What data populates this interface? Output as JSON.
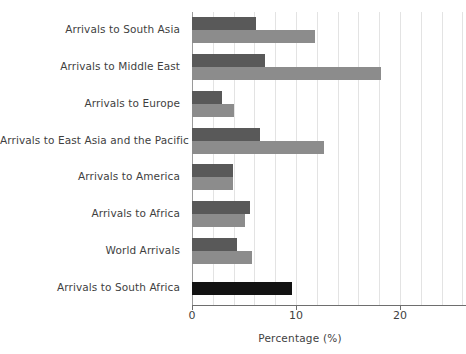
{
  "chart_data": {
    "type": "bar",
    "orientation": "horizontal",
    "title": "",
    "xlabel": "Percentage (%)",
    "ylabel": "",
    "xlim": [
      0,
      26
    ],
    "xticks": [
      0,
      10,
      20
    ],
    "xtick_labels": [
      "0",
      "10",
      "20"
    ],
    "grid": true,
    "grid_axis": "x",
    "grid_step": 2,
    "legend": "none",
    "categories": [
      "Arrivals to South Asia",
      "Arrivals to Middle East",
      "Arrivals to Europe",
      "Arrivals to East Asia and the Pacific",
      "Arrivals to America",
      "Arrivals to Africa",
      "World Arrivals",
      "Arrivals to South Africa"
    ],
    "series": [
      {
        "name": "series-dark",
        "color": "#595959",
        "values": [
          6.2,
          7.0,
          2.9,
          6.5,
          3.9,
          5.6,
          4.3,
          9.6
        ]
      },
      {
        "name": "series-light",
        "color": "#8c8c8c",
        "values": [
          11.8,
          18.2,
          4.0,
          12.7,
          3.9,
          5.1,
          5.8,
          null
        ]
      }
    ],
    "highlight": {
      "category": "Arrivals to South Africa",
      "color": "#121212",
      "value": 9.6
    },
    "colors": {
      "dark_bar": "#595959",
      "light_bar": "#8c8c8c",
      "highlight_bar": "#121212",
      "gridline": "#e3e3e3",
      "axis": "#6e6e6e",
      "text": "#3f3f3f",
      "background": "#ffffff"
    }
  }
}
